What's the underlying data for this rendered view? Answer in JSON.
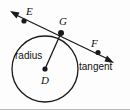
{
  "figure": {
    "background_color": "#fdfdfd",
    "stroke_color": "#1a1a1a",
    "width": 130,
    "height": 110
  },
  "labels": {
    "point_e": "E",
    "point_g": "G",
    "point_f": "F",
    "point_d": "D",
    "radius": "radius",
    "tangent": "tangent"
  },
  "geometry": {
    "circle": {
      "center_x": 45,
      "center_y": 69,
      "radius": 33
    },
    "points": {
      "D": {
        "x": 45,
        "y": 69
      },
      "G": {
        "x": 61,
        "y": 33
      },
      "E_dot": {
        "x": 24,
        "y": 21
      },
      "E_arrow_tip": {
        "x": 11,
        "y": 12
      },
      "F_dot": {
        "x": 98,
        "y": 52
      },
      "F_arrow_tip": {
        "x": 112,
        "y": 61
      }
    },
    "segments": [
      {
        "name": "radius-DG",
        "from": "D",
        "to": "G"
      },
      {
        "name": "tangent-EF",
        "from": "E_arrow_tip",
        "to": "F_arrow_tip"
      }
    ]
  }
}
